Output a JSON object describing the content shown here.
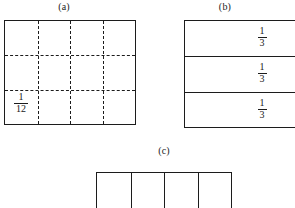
{
  "figure": {
    "background_color": "#ffffff",
    "line_color": "#1c1c1c",
    "width": 295,
    "height": 208
  },
  "panels": {
    "a": {
      "caption": "(a)",
      "shape": "rectangle",
      "columns": 4,
      "rows": 3,
      "total_cells": 12,
      "interior_line_style": "dashed",
      "border_line_style": "solid",
      "label": {
        "numerator": "1",
        "denominator": "12",
        "text": "1/12",
        "cell": "bottom-left"
      }
    },
    "b": {
      "caption": "(b)",
      "shape": "rectangle",
      "columns": 1,
      "rows": 3,
      "total_cells": 3,
      "interior_line_style": "solid",
      "border_line_style": "solid",
      "clipped_edge": "right",
      "row_labels": [
        {
          "numerator": "1",
          "denominator": "3",
          "text": "1/3"
        },
        {
          "numerator": "1",
          "denominator": "3",
          "text": "1/3"
        },
        {
          "numerator": "1",
          "denominator": "3",
          "text": "1/3"
        }
      ]
    },
    "c": {
      "caption": "(c)",
      "shape": "rectangle",
      "columns": 4,
      "rows": 1,
      "total_cells": 4,
      "interior_line_style": "solid",
      "border_line_style": "solid",
      "clipped_edge": "bottom",
      "labels": []
    }
  }
}
